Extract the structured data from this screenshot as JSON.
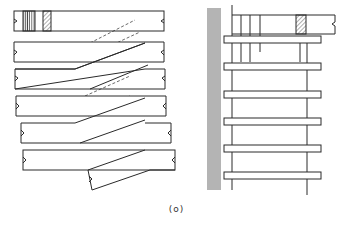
{
  "figure": {
    "caption": "(o)",
    "stroke_color": "#2a2a2a",
    "background": "#ffffff",
    "left_view": {
      "description": "stacked planks with diagonal splice cuts",
      "planks": [
        {
          "x": 14,
          "y": 11,
          "w": 150,
          "h": 20,
          "top_hatched": true
        },
        {
          "x": 14,
          "y": 42,
          "w": 150,
          "h": 20
        },
        {
          "x": 15,
          "y": 68,
          "w": 150,
          "h": 20
        },
        {
          "x": 16,
          "y": 95,
          "w": 150,
          "h": 20
        },
        {
          "x": 21,
          "y": 123,
          "w": 150,
          "h": 20
        },
        {
          "x": 23,
          "y": 150,
          "w": 152,
          "h": 20
        }
      ]
    },
    "right_view": {
      "description": "side elevation with post and cross rails",
      "rails_y": [
        36,
        63,
        91,
        118,
        145,
        172
      ]
    }
  }
}
